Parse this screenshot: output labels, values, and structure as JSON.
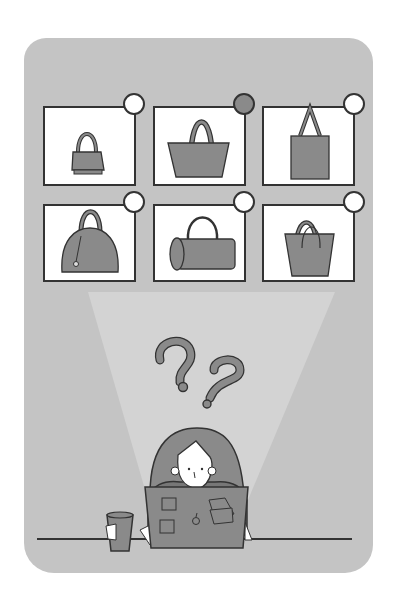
{
  "illustration": {
    "description": "Person at laptop confused choosing between six handbags",
    "colors": {
      "background": "#ffffff",
      "panel": "#c4c4c4",
      "spotlight": "#d6d6d6",
      "card": "#ffffff",
      "outline": "#333333",
      "fill": "#8a8a8a",
      "selected_indicator": "#8a8a8a"
    }
  },
  "grid": {
    "items": [
      {
        "name": "shoulder-bag",
        "selected": false
      },
      {
        "name": "tote-bag-wide",
        "selected": true
      },
      {
        "name": "tote-bag-tall",
        "selected": false
      },
      {
        "name": "dome-bag",
        "selected": false
      },
      {
        "name": "barrel-bag",
        "selected": false
      },
      {
        "name": "bucket-bag",
        "selected": false
      }
    ]
  },
  "thought": {
    "icons": [
      "question-mark-icon",
      "question-mark-icon"
    ]
  },
  "desk": {
    "items": [
      "laptop",
      "cup"
    ]
  }
}
